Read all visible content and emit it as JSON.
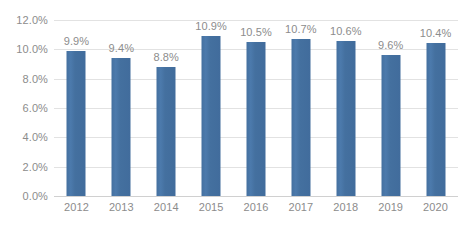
{
  "chart_data": {
    "type": "bar",
    "title": "",
    "subtitle": "",
    "xlabel": "",
    "ylabel": "",
    "categories": [
      "2012",
      "2013",
      "2014",
      "2015",
      "2016",
      "2017",
      "2018",
      "2019",
      "2020"
    ],
    "values": [
      9.9,
      9.4,
      8.8,
      10.9,
      10.5,
      10.7,
      10.6,
      9.6,
      10.4
    ],
    "data_labels": [
      "9.9%",
      "9.4%",
      "8.8%",
      "10.9%",
      "10.5%",
      "10.7%",
      "10.6%",
      "9.6%",
      "10.4%"
    ],
    "ylim": [
      0,
      12
    ],
    "ytick_values": [
      0,
      2,
      4,
      6,
      8,
      10,
      12
    ],
    "ytick_labels": [
      "0.0%",
      "2.0%",
      "4.0%",
      "6.0%",
      "8.0%",
      "10.0%",
      "12.0%"
    ],
    "grid": true,
    "legend": "none",
    "series_color": "#44709f",
    "gridline_color": "#e2e2e2",
    "text_color": "#8c8c8c",
    "background_color": "#ffffff"
  }
}
